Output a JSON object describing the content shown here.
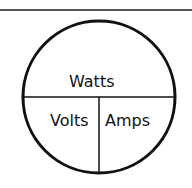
{
  "diagram": {
    "top_label": "Watts",
    "bottom_left_label": "Volts",
    "bottom_right_label": "Amps",
    "caption_fragment": "..."
  }
}
